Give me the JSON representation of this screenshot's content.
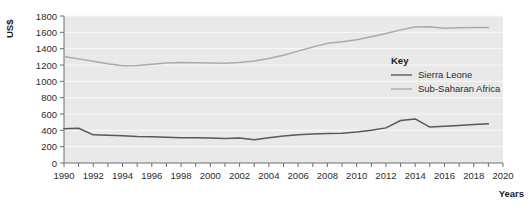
{
  "chart_data": {
    "type": "line",
    "title": "",
    "xlabel": "Years",
    "ylabel": "US$",
    "xlim": [
      1990,
      2020
    ],
    "ylim": [
      0,
      1800
    ],
    "ytick_step": 200,
    "grid": true,
    "legend_position": "inside-right",
    "legend_title": "Key",
    "x": [
      1990,
      1991,
      1992,
      1993,
      1994,
      1995,
      1996,
      1997,
      1998,
      1999,
      2000,
      2001,
      2002,
      2003,
      2004,
      2005,
      2006,
      2007,
      2008,
      2009,
      2010,
      2011,
      2012,
      2013,
      2014,
      2015,
      2016,
      2017,
      2018,
      2019
    ],
    "xticks": [
      1990,
      1991,
      1992,
      1993,
      1994,
      1995,
      1996,
      1997,
      1998,
      1999,
      2000,
      2001,
      2002,
      2003,
      2004,
      2005,
      2006,
      2007,
      2008,
      2009,
      2010,
      2011,
      2012,
      2013,
      2014,
      2015,
      2016,
      2017,
      2018,
      2019,
      2020
    ],
    "xtick_labels": [
      "1990",
      "",
      "1992",
      "",
      "1994",
      "",
      "1996",
      "",
      "1998",
      "",
      "2000",
      "",
      "2002",
      "",
      "2004",
      "",
      "2006",
      "",
      "2008",
      "",
      "2010",
      "",
      "2012",
      "",
      "2014",
      "",
      "2016",
      "",
      "2018",
      "",
      "2020"
    ],
    "ytick_labels": [
      "0",
      "200",
      "400",
      "600",
      "800",
      "1000",
      "1200",
      "1400",
      "1600",
      "1800"
    ],
    "yticks": [
      0,
      200,
      400,
      600,
      800,
      1000,
      1200,
      1400,
      1600,
      1800
    ],
    "series": [
      {
        "name": "Sierra Leone",
        "color": "#595959",
        "values": [
          420,
          425,
          345,
          340,
          335,
          325,
          320,
          315,
          310,
          308,
          305,
          300,
          305,
          285,
          310,
          330,
          345,
          355,
          360,
          365,
          380,
          400,
          430,
          520,
          540,
          440,
          450,
          460,
          470,
          480
        ]
      },
      {
        "name": "Sub-Saharan Africa",
        "color": "#aaaaaa",
        "values": [
          1305,
          1275,
          1245,
          1215,
          1190,
          1195,
          1210,
          1225,
          1230,
          1228,
          1225,
          1222,
          1230,
          1250,
          1280,
          1320,
          1370,
          1420,
          1465,
          1485,
          1510,
          1545,
          1585,
          1630,
          1665,
          1668,
          1650,
          1655,
          1660,
          1660
        ]
      }
    ]
  },
  "legend": {
    "title": "Key",
    "entries": [
      {
        "label": "Sierra Leone",
        "color": "#595959"
      },
      {
        "label": "Sub-Saharan Africa",
        "color": "#aaaaaa"
      }
    ]
  },
  "axes": {
    "y_axis_title": "US$",
    "x_axis_title": "Years"
  },
  "colors": {
    "plot_background": "#e9e9e9",
    "gridline": "#f7f7f7",
    "axis_line": "#6e6e6e",
    "page_background": "#ffffff",
    "sierra_leone": "#595959",
    "sub_saharan_africa": "#aaaaaa"
  }
}
